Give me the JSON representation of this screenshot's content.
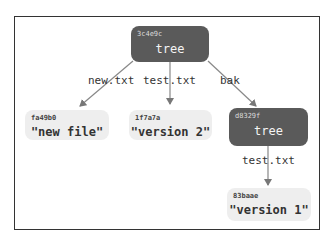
{
  "diagram": {
    "nodes": [
      {
        "id": "root",
        "hash": "3c4e9c",
        "label": "tree",
        "type": "tree",
        "color": "#5a5a5a"
      },
      {
        "id": "newfile",
        "hash": "fa49b0",
        "label": "\"new file\"",
        "type": "blob",
        "color": "#eeeeee"
      },
      {
        "id": "v2",
        "hash": "1f7a7a",
        "label": "\"version 2\"",
        "type": "blob",
        "color": "#eeeeee"
      },
      {
        "id": "bak",
        "hash": "d8329f",
        "label": "tree",
        "type": "tree",
        "color": "#5a5a5a"
      },
      {
        "id": "v1",
        "hash": "83baae",
        "label": "\"version 1\"",
        "type": "blob",
        "color": "#eeeeee"
      }
    ],
    "edges": [
      {
        "from": "root",
        "to": "newfile",
        "label": "new.txt"
      },
      {
        "from": "root",
        "to": "v2",
        "label": "test.txt"
      },
      {
        "from": "root",
        "to": "bak",
        "label": "bak"
      },
      {
        "from": "bak",
        "to": "v1",
        "label": "test.txt"
      }
    ]
  }
}
